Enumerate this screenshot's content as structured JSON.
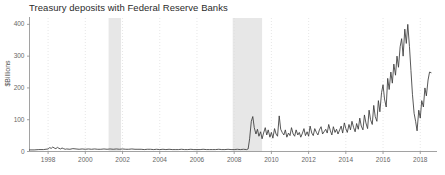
{
  "chart_data": {
    "type": "line",
    "title": "Treasury deposits with Federal Reserve Banks",
    "xlabel": "",
    "ylabel": "$Billions",
    "xlim": [
      1997.0,
      2018.9
    ],
    "ylim": [
      0,
      420
    ],
    "yticks": [
      0,
      100,
      200,
      300,
      400
    ],
    "ytick_labels": [
      "0",
      "100",
      "200",
      "300",
      "400"
    ],
    "xticks": [
      1998,
      2000,
      2002,
      2004,
      2006,
      2008,
      2010,
      2012,
      2014,
      2016,
      2018
    ],
    "xtick_labels": [
      "1998",
      "2000",
      "2002",
      "2004",
      "2006",
      "2008",
      "2010",
      "2012",
      "2014",
      "2016",
      "2018"
    ],
    "grid": "vertical-dotted",
    "legend": "none",
    "line_color": "#3a3a3a",
    "grid_color": "#dcdcdc",
    "axis_color": "#8a8a8a",
    "background_color": "#ffffff",
    "recession_color": "#e7e7e7",
    "recession_bands": [
      {
        "label": "2001 recession",
        "start": 2001.25,
        "end": 2001.92
      },
      {
        "label": "2007-2009 recession",
        "start": 2007.92,
        "end": 2009.5
      }
    ],
    "x": [
      1997.0,
      1997.25,
      1997.5,
      1997.75,
      1998.0,
      1998.08,
      1998.17,
      1998.25,
      1998.33,
      1998.42,
      1998.5,
      1998.58,
      1998.67,
      1998.75,
      1998.83,
      1998.92,
      1999.0,
      1999.17,
      1999.33,
      1999.5,
      1999.67,
      1999.83,
      2000.0,
      2000.17,
      2000.33,
      2000.5,
      2000.67,
      2000.83,
      2001.0,
      2001.17,
      2001.33,
      2001.5,
      2001.67,
      2001.83,
      2002.0,
      2002.17,
      2002.33,
      2002.5,
      2002.67,
      2002.83,
      2003.0,
      2003.17,
      2003.33,
      2003.5,
      2003.67,
      2003.83,
      2004.0,
      2004.17,
      2004.33,
      2004.5,
      2004.67,
      2004.83,
      2005.0,
      2005.17,
      2005.33,
      2005.5,
      2005.67,
      2005.83,
      2006.0,
      2006.17,
      2006.33,
      2006.5,
      2006.67,
      2006.83,
      2007.0,
      2007.17,
      2007.33,
      2007.5,
      2007.67,
      2007.83,
      2008.0,
      2008.17,
      2008.33,
      2008.5,
      2008.67,
      2008.75,
      2008.83,
      2008.92,
      2009.0,
      2009.08,
      2009.17,
      2009.25,
      2009.33,
      2009.42,
      2009.5,
      2009.58,
      2009.67,
      2009.75,
      2009.83,
      2009.92,
      2010.0,
      2010.08,
      2010.17,
      2010.25,
      2010.33,
      2010.42,
      2010.5,
      2010.58,
      2010.67,
      2010.75,
      2010.83,
      2010.92,
      2011.0,
      2011.08,
      2011.17,
      2011.25,
      2011.33,
      2011.42,
      2011.5,
      2011.58,
      2011.67,
      2011.75,
      2011.83,
      2011.92,
      2012.0,
      2012.08,
      2012.17,
      2012.25,
      2012.33,
      2012.42,
      2012.5,
      2012.58,
      2012.67,
      2012.75,
      2012.83,
      2012.92,
      2013.0,
      2013.08,
      2013.17,
      2013.25,
      2013.33,
      2013.42,
      2013.5,
      2013.58,
      2013.67,
      2013.75,
      2013.83,
      2013.92,
      2014.0,
      2014.08,
      2014.17,
      2014.25,
      2014.33,
      2014.42,
      2014.5,
      2014.58,
      2014.67,
      2014.75,
      2014.83,
      2014.92,
      2015.0,
      2015.08,
      2015.17,
      2015.25,
      2015.33,
      2015.42,
      2015.5,
      2015.58,
      2015.67,
      2015.75,
      2015.83,
      2015.92,
      2016.0,
      2016.08,
      2016.17,
      2016.25,
      2016.33,
      2016.42,
      2016.5,
      2016.58,
      2016.67,
      2016.75,
      2016.83,
      2016.92,
      2017.0,
      2017.08,
      2017.17,
      2017.25,
      2017.33,
      2017.42,
      2017.5,
      2017.58,
      2017.67,
      2017.75,
      2017.83,
      2017.92,
      2018.0,
      2018.08,
      2018.17,
      2018.25,
      2018.33,
      2018.42,
      2018.5,
      2018.58
    ],
    "values": [
      5,
      5,
      6,
      6,
      8,
      12,
      10,
      14,
      11,
      9,
      13,
      10,
      8,
      11,
      9,
      7,
      8,
      7,
      9,
      8,
      7,
      8,
      7,
      8,
      7,
      8,
      7,
      7,
      8,
      7,
      8,
      7,
      8,
      7,
      8,
      7,
      7,
      8,
      7,
      7,
      7,
      6,
      7,
      7,
      6,
      7,
      6,
      7,
      6,
      7,
      6,
      6,
      6,
      7,
      6,
      6,
      7,
      6,
      6,
      6,
      7,
      6,
      6,
      6,
      6,
      7,
      6,
      6,
      7,
      6,
      6,
      7,
      6,
      7,
      6,
      8,
      40,
      95,
      110,
      75,
      55,
      70,
      48,
      62,
      40,
      58,
      75,
      52,
      68,
      45,
      60,
      42,
      72,
      55,
      48,
      112,
      70,
      60,
      52,
      68,
      45,
      58,
      50,
      75,
      55,
      48,
      68,
      52,
      60,
      45,
      58,
      72,
      50,
      62,
      48,
      80,
      58,
      50,
      72,
      60,
      52,
      68,
      78,
      55,
      62,
      70,
      58,
      85,
      65,
      52,
      78,
      60,
      70,
      55,
      68,
      80,
      58,
      90,
      72,
      60,
      85,
      68,
      95,
      75,
      62,
      88,
      70,
      105,
      80,
      68,
      115,
      90,
      72,
      130,
      100,
      85,
      145,
      110,
      95,
      160,
      125,
      185,
      210,
      165,
      140,
      230,
      195,
      250,
      215,
      275,
      240,
      300,
      265,
      330,
      355,
      300,
      385,
      340,
      400,
      330,
      255,
      180,
      120,
      95,
      65,
      130,
      105,
      160,
      140,
      200,
      175,
      225,
      250,
      248
    ]
  }
}
